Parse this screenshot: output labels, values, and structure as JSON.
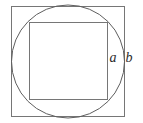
{
  "figure": {
    "background_color": "#ffffff",
    "stroke_color": "#767676",
    "stroke_width": 1,
    "canvas": {
      "width": 143,
      "height": 123
    },
    "shapes": {
      "outer_square": {
        "name": "outer-square",
        "x": 11.5,
        "y": 6.5,
        "width": 113,
        "height": 110,
        "side_label": "b"
      },
      "circle": {
        "name": "inscribed-circle",
        "cx": 68,
        "cy": 61.5,
        "r": 56.5
      },
      "inner_square": {
        "name": "inner-square",
        "x": 29.5,
        "y": 22.5,
        "width": 78,
        "height": 77,
        "side_label": "a"
      }
    },
    "labels": [
      {
        "id": "label-a",
        "name": "label-a",
        "text": "a",
        "x": 113,
        "y": 62,
        "font_size": 14,
        "color": "#2b2b2b",
        "describes": "inner square side"
      },
      {
        "id": "label-b",
        "name": "label-b",
        "text": "b",
        "x": 129,
        "y": 62,
        "font_size": 14,
        "color": "#2b2b2b",
        "describes": "outer square side"
      }
    ]
  }
}
